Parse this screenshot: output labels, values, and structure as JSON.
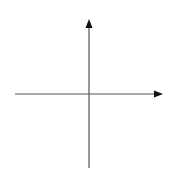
{
  "diagram": {
    "type": "cartesian-axes",
    "origin": {
      "x": 89,
      "y": 94
    },
    "x_axis": {
      "start": {
        "x": 15,
        "y": 94
      },
      "end": {
        "x": 163,
        "y": 94
      },
      "arrow": "right",
      "label": ""
    },
    "y_axis": {
      "start": {
        "x": 89,
        "y": 168
      },
      "end": {
        "x": 89,
        "y": 19
      },
      "arrow": "up",
      "label": ""
    },
    "colors": {
      "axis_line": "#555555",
      "arrowhead": "#111111",
      "background": "#ffffff"
    }
  }
}
